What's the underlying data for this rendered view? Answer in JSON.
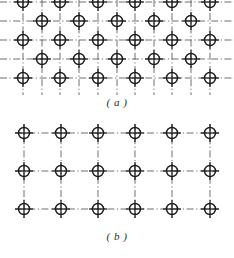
{
  "figure": {
    "background_color": "#ffffff",
    "ink_color": "#1a1a1a",
    "lattice_line_color": "#555555",
    "width": 234,
    "height": 258
  },
  "panels": [
    {
      "id": "a",
      "caption": "( a )",
      "description": "body-centered rectangular lattice with staggered interstitial atoms",
      "symbol": "circled-cross-atom",
      "geometry": {
        "main_columns_x": [
          23,
          60,
          98,
          135,
          172,
          210
        ],
        "main_rows_y": [
          2,
          40,
          78
        ],
        "offset_columns_x": [
          42,
          79,
          117,
          154,
          191
        ],
        "offset_rows_y": [
          21,
          59
        ],
        "circle_radius": 5.5,
        "cross_arm": 9
      },
      "counts": {
        "main_atoms": 18,
        "offset_atoms": 10,
        "total_atoms": 28
      }
    },
    {
      "id": "b",
      "caption": "( b )",
      "description": "simple rectangular lattice, 6 columns by 3 rows",
      "symbol": "circled-cross-atom",
      "geometry": {
        "columns_x": [
          24,
          61,
          98,
          135,
          172,
          210
        ],
        "rows_y": [
          15,
          53,
          91
        ],
        "circle_radius": 5.5,
        "cross_arm": 9
      },
      "counts": {
        "columns": 6,
        "rows": 3,
        "total_atoms": 18
      }
    }
  ]
}
